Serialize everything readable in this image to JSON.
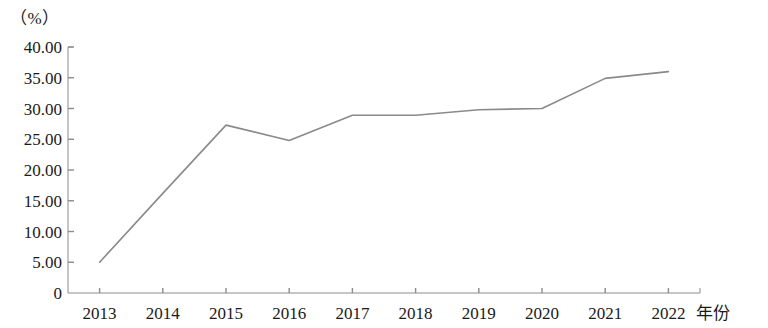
{
  "chart_data": {
    "type": "line",
    "title": "",
    "subtitle": "",
    "xlabel": "年份",
    "ylabel": "（%）",
    "categories": [
      "2013",
      "2014",
      "2015",
      "2016",
      "2017",
      "2018",
      "2019",
      "2020",
      "2021",
      "2022"
    ],
    "series": [
      {
        "name": "",
        "values": [
          5.0,
          16.2,
          27.3,
          24.8,
          28.9,
          28.9,
          29.8,
          30.0,
          34.9,
          36.0
        ]
      }
    ],
    "ylim": [
      0,
      40
    ],
    "ytick_labels": [
      "40.00",
      "35.00",
      "30.00",
      "25.00",
      "20.00",
      "15.00",
      "10.00",
      "5.00",
      "0"
    ],
    "ytick_values": [
      40,
      35,
      30,
      25,
      20,
      15,
      10,
      5,
      0
    ],
    "xtick_labels": [
      "2013",
      "2014",
      "2015",
      "2016",
      "2017",
      "2018",
      "2019",
      "2020",
      "2021",
      "2022"
    ],
    "grid": false,
    "legend": false,
    "legend_position": "none",
    "line_color": "#8a8a8a",
    "axis_color": "#8c8c8c",
    "text_color": "#1a1a1a",
    "markers": false
  }
}
